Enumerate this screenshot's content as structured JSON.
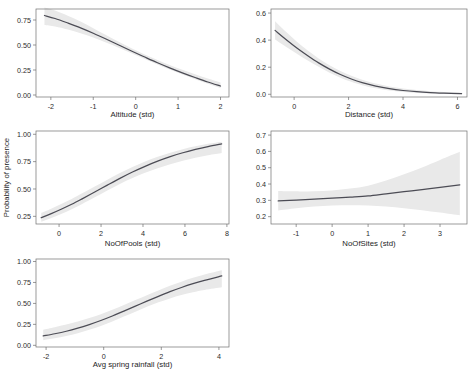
{
  "figure": {
    "shared_ylabel": "Probability of presence",
    "line_color": "#4c4c55",
    "band_color": "#e9e9e9",
    "frame_color": "#6f6f6f",
    "background": "#ffffff"
  },
  "chart_data": [
    {
      "type": "line",
      "id": "altitude",
      "title": "",
      "xlabel": "Altitude (std)",
      "ylabel": "Probability of presence",
      "xlim": [
        -2.35,
        2.2
      ],
      "ylim": [
        -0.02,
        0.86
      ],
      "xticks": [
        -2,
        -1,
        0,
        1,
        2
      ],
      "xticklabels": [
        "-2",
        "-1",
        "0",
        "1",
        "2"
      ],
      "yticks": [
        0.0,
        0.25,
        0.5,
        0.75
      ],
      "yticklabels": [
        "0.00",
        "0.25",
        "0.50",
        "0.75"
      ],
      "grid": false,
      "legend": "none",
      "x": [
        -2.15,
        -1.9,
        -1.6,
        -1.3,
        -1.0,
        -0.7,
        -0.4,
        -0.1,
        0.2,
        0.5,
        0.8,
        1.1,
        1.4,
        1.7,
        2.0
      ],
      "y": [
        0.795,
        0.765,
        0.72,
        0.672,
        0.618,
        0.56,
        0.5,
        0.44,
        0.382,
        0.325,
        0.272,
        0.222,
        0.175,
        0.13,
        0.09
      ],
      "ci_lower": [
        0.7,
        0.685,
        0.655,
        0.618,
        0.575,
        0.525,
        0.472,
        0.417,
        0.362,
        0.308,
        0.255,
        0.205,
        0.158,
        0.112,
        0.068
      ],
      "ci_upper": [
        0.875,
        0.845,
        0.793,
        0.735,
        0.668,
        0.6,
        0.532,
        0.468,
        0.408,
        0.352,
        0.3,
        0.252,
        0.208,
        0.165,
        0.125
      ]
    },
    {
      "type": "line",
      "id": "distance",
      "title": "",
      "xlabel": "Distance (std)",
      "ylabel": "Probability of presence",
      "xlim": [
        -0.85,
        6.35
      ],
      "ylim": [
        -0.02,
        0.63
      ],
      "xticks": [
        0,
        2,
        4,
        6
      ],
      "xticklabels": [
        "0",
        "2",
        "4",
        "6"
      ],
      "yticks": [
        0.0,
        0.2,
        0.4,
        0.6
      ],
      "yticklabels": [
        "0.0",
        "0.2",
        "0.4",
        "0.6"
      ],
      "grid": false,
      "legend": "none",
      "x": [
        -0.7,
        -0.3,
        0.1,
        0.5,
        0.9,
        1.3,
        1.7,
        2.1,
        2.5,
        3.0,
        3.5,
        4.0,
        4.5,
        5.0,
        5.5,
        6.15
      ],
      "y": [
        0.472,
        0.405,
        0.342,
        0.285,
        0.232,
        0.186,
        0.146,
        0.113,
        0.086,
        0.06,
        0.041,
        0.028,
        0.019,
        0.013,
        0.009,
        0.005
      ],
      "ci_lower": [
        0.405,
        0.352,
        0.3,
        0.25,
        0.203,
        0.16,
        0.123,
        0.092,
        0.067,
        0.044,
        0.028,
        0.017,
        0.01,
        0.006,
        0.003,
        0.001
      ],
      "ci_upper": [
        0.54,
        0.462,
        0.388,
        0.323,
        0.265,
        0.215,
        0.172,
        0.137,
        0.108,
        0.08,
        0.058,
        0.043,
        0.031,
        0.023,
        0.017,
        0.012
      ]
    },
    {
      "type": "line",
      "id": "nofpools",
      "title": "",
      "xlabel": "NoOfPools (std)",
      "ylabel": "Probability of presence",
      "xlim": [
        -1.1,
        8.1
      ],
      "ylim": [
        0.18,
        1.03
      ],
      "xticks": [
        0,
        2,
        4,
        6,
        8
      ],
      "xticklabels": [
        "0",
        "2",
        "4",
        "6",
        "8"
      ],
      "yticks": [
        0.25,
        0.5,
        0.75,
        1.0
      ],
      "yticklabels": [
        "0.25",
        "0.50",
        "0.75",
        "1.00"
      ],
      "grid": false,
      "legend": "none",
      "x": [
        -0.85,
        -0.4,
        0.1,
        0.6,
        1.1,
        1.7,
        2.3,
        2.9,
        3.5,
        4.1,
        4.7,
        5.3,
        5.9,
        6.5,
        7.1,
        7.75
      ],
      "y": [
        0.238,
        0.273,
        0.315,
        0.36,
        0.41,
        0.472,
        0.535,
        0.597,
        0.655,
        0.707,
        0.754,
        0.795,
        0.831,
        0.862,
        0.888,
        0.912
      ],
      "ci_lower": [
        0.2,
        0.233,
        0.272,
        0.315,
        0.363,
        0.424,
        0.486,
        0.546,
        0.6,
        0.648,
        0.69,
        0.727,
        0.758,
        0.785,
        0.808,
        0.828
      ],
      "ci_upper": [
        0.282,
        0.318,
        0.362,
        0.408,
        0.46,
        0.522,
        0.585,
        0.645,
        0.702,
        0.752,
        0.795,
        0.832,
        0.864,
        0.89,
        0.913,
        0.932
      ]
    },
    {
      "type": "line",
      "id": "nofsites",
      "title": "",
      "xlabel": "NoOfSites (std)",
      "ylabel": "Probability of presence",
      "xlim": [
        -1.7,
        3.75
      ],
      "ylim": [
        0.155,
        0.725
      ],
      "xticks": [
        -1,
        0,
        1,
        2,
        3
      ],
      "xticklabels": [
        "-1",
        "0",
        "1",
        "2",
        "3"
      ],
      "yticks": [
        0.2,
        0.3,
        0.4,
        0.5,
        0.6,
        0.7
      ],
      "yticklabels": [
        "0.2",
        "0.3",
        "0.4",
        "0.5",
        "0.6",
        "0.7"
      ],
      "grid": false,
      "legend": "none",
      "x": [
        -1.5,
        -1.0,
        -0.5,
        0.0,
        0.5,
        1.0,
        1.5,
        2.0,
        2.5,
        3.0,
        3.55
      ],
      "y": [
        0.296,
        0.302,
        0.308,
        0.314,
        0.32,
        0.327,
        0.34,
        0.353,
        0.366,
        0.38,
        0.395
      ],
      "ci_lower": [
        0.238,
        0.252,
        0.262,
        0.268,
        0.27,
        0.268,
        0.262,
        0.252,
        0.24,
        0.225,
        0.208
      ],
      "ci_upper": [
        0.358,
        0.355,
        0.356,
        0.36,
        0.372,
        0.39,
        0.422,
        0.46,
        0.502,
        0.548,
        0.598
      ]
    },
    {
      "type": "line",
      "id": "rainfall",
      "title": "",
      "xlabel": "Avg spring rainfall (std)",
      "ylabel": "Probability of presence",
      "xlim": [
        -2.35,
        4.35
      ],
      "ylim": [
        -0.02,
        1.03
      ],
      "xticks": [
        -2,
        0,
        2,
        4
      ],
      "xticklabels": [
        "-2",
        "0",
        "2",
        "4"
      ],
      "yticks": [
        0.0,
        0.25,
        0.5,
        0.75,
        1.0
      ],
      "yticklabels": [
        "0.00",
        "0.25",
        "0.50",
        "0.75",
        "1.00"
      ],
      "grid": false,
      "legend": "none",
      "x": [
        -2.1,
        -1.7,
        -1.3,
        -0.9,
        -0.5,
        -0.1,
        0.3,
        0.7,
        1.1,
        1.5,
        1.9,
        2.3,
        2.7,
        3.1,
        3.5,
        4.1
      ],
      "y": [
        0.112,
        0.138,
        0.168,
        0.205,
        0.248,
        0.296,
        0.35,
        0.408,
        0.467,
        0.527,
        0.585,
        0.64,
        0.69,
        0.735,
        0.775,
        0.828
      ],
      "ci_lower": [
        0.062,
        0.085,
        0.112,
        0.145,
        0.185,
        0.232,
        0.285,
        0.343,
        0.402,
        0.46,
        0.513,
        0.56,
        0.6,
        0.633,
        0.66,
        0.692
      ],
      "ci_upper": [
        0.185,
        0.215,
        0.247,
        0.283,
        0.325,
        0.372,
        0.425,
        0.482,
        0.54,
        0.598,
        0.655,
        0.71,
        0.76,
        0.805,
        0.845,
        0.895
      ]
    }
  ]
}
